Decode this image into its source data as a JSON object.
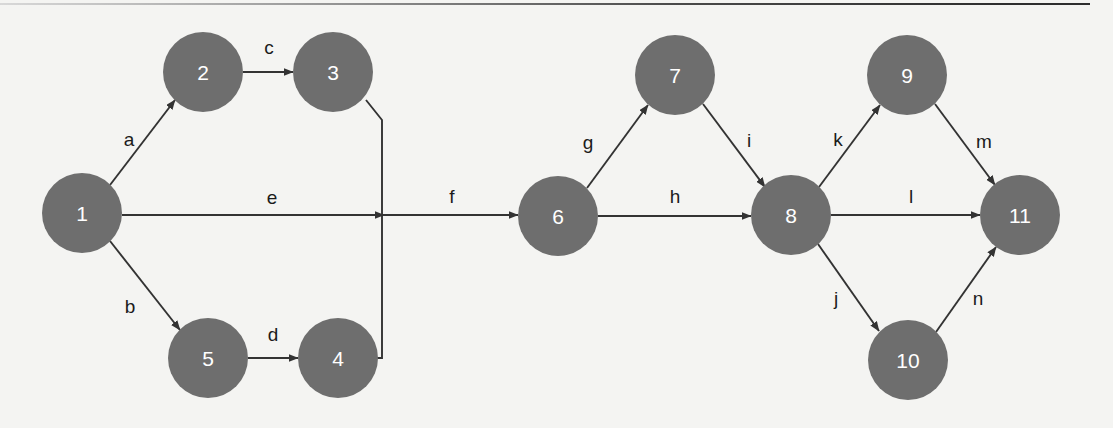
{
  "diagram": {
    "background_color": "#f4f4f2",
    "node_fill": "#6e6e6e",
    "node_text_color": "#ffffff",
    "edge_color": "#333333",
    "edge_label_color": "#1b1b1b",
    "node_radius": 40,
    "nodes": [
      {
        "id": "1",
        "label": "1",
        "cx": 82,
        "cy": 213
      },
      {
        "id": "2",
        "label": "2",
        "cx": 203,
        "cy": 72
      },
      {
        "id": "3",
        "label": "3",
        "cx": 333,
        "cy": 72
      },
      {
        "id": "4",
        "label": "4",
        "cx": 338,
        "cy": 358
      },
      {
        "id": "5",
        "label": "5",
        "cx": 208,
        "cy": 358
      },
      {
        "id": "6",
        "label": "6",
        "cx": 558,
        "cy": 216
      },
      {
        "id": "7",
        "label": "7",
        "cx": 675,
        "cy": 75
      },
      {
        "id": "8",
        "label": "8",
        "cx": 791,
        "cy": 215
      },
      {
        "id": "9",
        "label": "9",
        "cx": 907,
        "cy": 75
      },
      {
        "id": "10",
        "label": "10",
        "cx": 908,
        "cy": 360
      },
      {
        "id": "11",
        "label": "11",
        "cx": 1020,
        "cy": 215
      }
    ],
    "edges": [
      {
        "id": "a",
        "label": "a",
        "from": "1",
        "to": "2",
        "label_x": 129,
        "label_y": 139
      },
      {
        "id": "b",
        "label": "b",
        "from": "1",
        "to": "5",
        "label_x": 130,
        "label_y": 306
      },
      {
        "id": "c",
        "label": "c",
        "from": "2",
        "to": "3",
        "label_x": 269,
        "label_y": 47
      },
      {
        "id": "d",
        "label": "d",
        "from": "5",
        "to": "4",
        "label_x": 273,
        "label_y": 334
      },
      {
        "id": "e",
        "label": "e",
        "from": "1",
        "to": "junction",
        "label_x": 272,
        "label_y": 197
      },
      {
        "id": "f",
        "label": "f",
        "from": "junction",
        "to": "6",
        "label_x": 452,
        "label_y": 196
      },
      {
        "id": "g",
        "label": "g",
        "from": "6",
        "to": "7",
        "label_x": 588,
        "label_y": 142
      },
      {
        "id": "h",
        "label": "h",
        "from": "6",
        "to": "8",
        "label_x": 675,
        "label_y": 196
      },
      {
        "id": "i",
        "label": "i",
        "from": "7",
        "to": "8",
        "label_x": 749,
        "label_y": 140
      },
      {
        "id": "j",
        "label": "j",
        "from": "8",
        "to": "10",
        "label_x": 836,
        "label_y": 298
      },
      {
        "id": "k",
        "label": "k",
        "from": "8",
        "to": "9",
        "label_x": 838,
        "label_y": 139
      },
      {
        "id": "l",
        "label": "l",
        "from": "8",
        "to": "11",
        "label_x": 911,
        "label_y": 196
      },
      {
        "id": "m",
        "label": "m",
        "from": "9",
        "to": "11",
        "label_x": 984,
        "label_y": 141
      },
      {
        "id": "n",
        "label": "n",
        "from": "10",
        "to": "11",
        "label_x": 978,
        "label_y": 298
      }
    ],
    "connector_path": {
      "description": "vertical rail from node 3 bottom down past node 4, joined by edge e arrowhead",
      "x": 382,
      "top_y": 96,
      "bottom_y": 358
    }
  }
}
